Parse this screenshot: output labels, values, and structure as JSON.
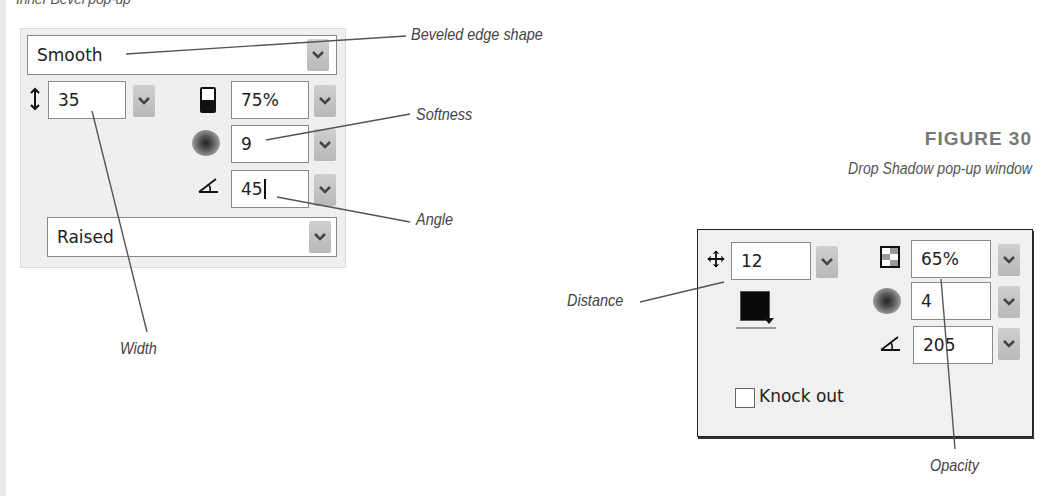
{
  "top_caption": "Inner Bevel pop-up",
  "inner_bevel": {
    "edge_shape": {
      "value": "Smooth"
    },
    "width": {
      "value": "35"
    },
    "contrast": {
      "value": "75%"
    },
    "softness": {
      "value": "9"
    },
    "angle": {
      "value": "45"
    },
    "button_preset": {
      "value": "Raised"
    },
    "icons": {
      "width": "vertical-resize-icon",
      "contrast": "contrast-icon",
      "softness": "softness-icon",
      "angle": "angle-icon"
    }
  },
  "inner_callouts": {
    "edge_shape": "Beveled edge shape",
    "softness": "Softness",
    "angle": "Angle",
    "width": "Width"
  },
  "figure": {
    "label": "FIGURE 30",
    "caption": "Drop Shadow pop-up window"
  },
  "drop_shadow": {
    "distance": {
      "value": "12"
    },
    "color": {
      "hex": "#0a0a0a"
    },
    "opacity": {
      "value": "65%"
    },
    "softness": {
      "value": "4"
    },
    "angle": {
      "value": "205"
    },
    "knockout": {
      "label": "Knock out",
      "checked": false
    },
    "icons": {
      "distance": "move-icon",
      "opacity": "opacity-icon",
      "softness": "softness-icon",
      "angle": "angle-icon"
    }
  },
  "drop_callouts": {
    "distance": "Distance",
    "opacity": "Opacity"
  }
}
